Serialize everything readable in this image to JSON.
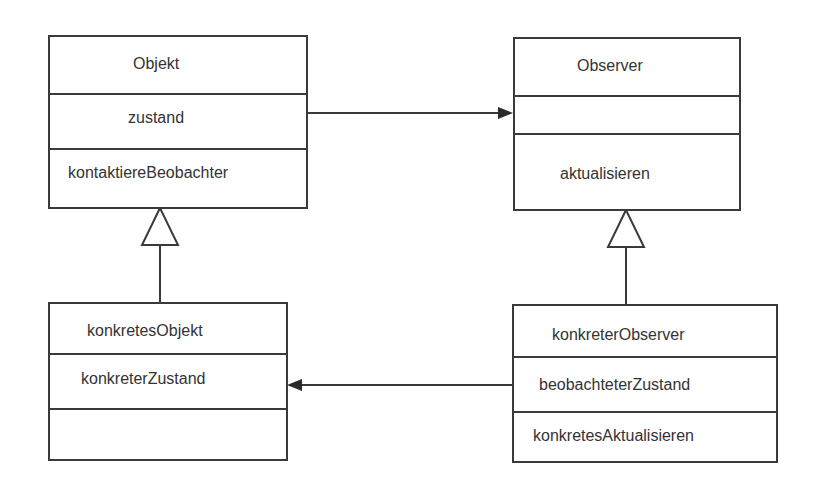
{
  "diagram": {
    "type": "UML class diagram (Observer pattern)",
    "classes": [
      {
        "id": "objekt",
        "name": "Objekt",
        "attributes": [
          "zustand"
        ],
        "operations": [
          "kontaktiereBeobachter"
        ]
      },
      {
        "id": "observer",
        "name": "Observer",
        "attributes": [
          ""
        ],
        "operations": [
          "aktualisieren"
        ]
      },
      {
        "id": "konkretesObjekt",
        "name": "konkretesObjekt",
        "attributes": [
          "konkreterZustand"
        ],
        "operations": [
          ""
        ]
      },
      {
        "id": "konkreterObserver",
        "name": "konkreterObserver",
        "attributes": [
          "beobachteterZustand"
        ],
        "operations": [
          "konkretesAktualisieren"
        ]
      }
    ],
    "relations": [
      {
        "from": "objekt",
        "to": "observer",
        "kind": "association",
        "arrow": "filled"
      },
      {
        "from": "konkreterObserver",
        "to": "konkretesObjekt",
        "kind": "association",
        "arrow": "filled"
      },
      {
        "from": "konkretesObjekt",
        "to": "objekt",
        "kind": "generalization",
        "arrow": "hollow-triangle"
      },
      {
        "from": "konkreterObserver",
        "to": "observer",
        "kind": "generalization",
        "arrow": "hollow-triangle"
      }
    ],
    "colors": {
      "line": "#3a3a3a",
      "background": "#ffffff",
      "text": "#333333"
    }
  }
}
